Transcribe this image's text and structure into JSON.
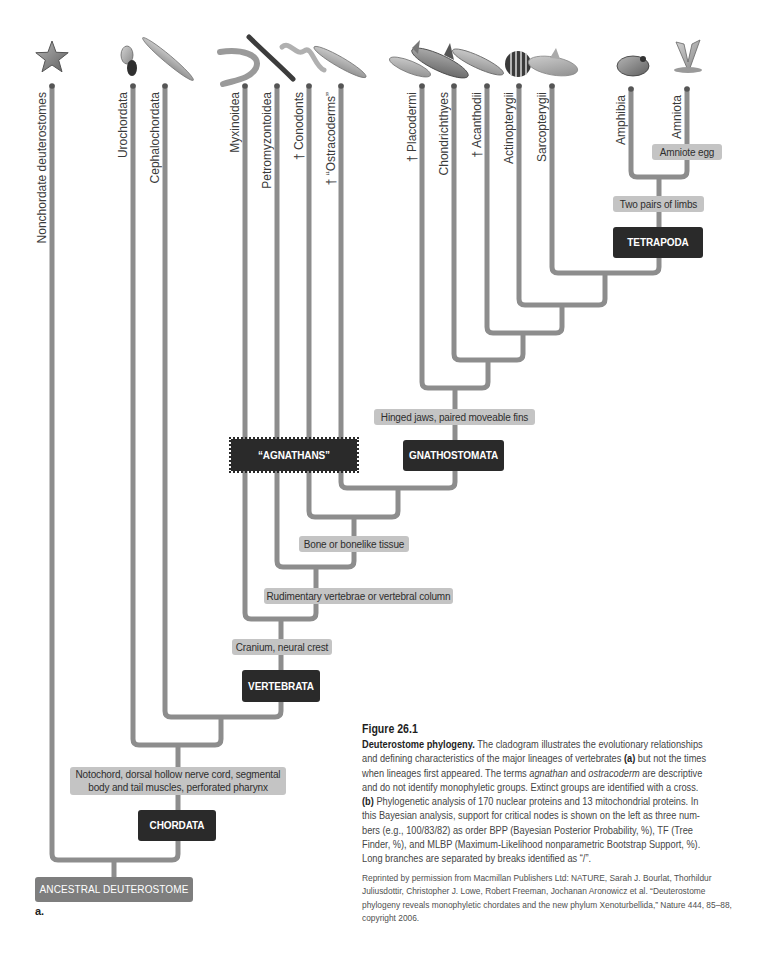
{
  "leaves": [
    {
      "label": "Nonchordate deuterostomes",
      "icon": "starfish"
    },
    {
      "label": "Urochordata",
      "icon": "sea-squirt"
    },
    {
      "label": "Cephalochordata",
      "icon": "lancelet"
    },
    {
      "label": "Myxinoidea",
      "icon": "hagfish"
    },
    {
      "label": "Petromyzontoidea",
      "icon": "lamprey"
    },
    {
      "label": "† Conodonts",
      "icon": "conodont"
    },
    {
      "label": "† “Ostracoderms”",
      "icon": "ostracoderm"
    },
    {
      "label": "† Placodermi",
      "icon": "placoderm"
    },
    {
      "label": "Chondrichthyes",
      "icon": "shark"
    },
    {
      "label": "† Acanthodii",
      "icon": "acanthodian"
    },
    {
      "label": "Actinopterygii",
      "icon": "ray-finned-fish"
    },
    {
      "label": "Sarcopterygii",
      "icon": "coelacanth"
    },
    {
      "label": "Amphibia",
      "icon": "frog"
    },
    {
      "label": "Amniota",
      "icon": "bird"
    }
  ],
  "characters": {
    "amniote_egg": "Amniote egg",
    "two_pairs_limbs": "Two pairs of limbs",
    "hinged_jaws": "Hinged jaws, paired moveable fins",
    "bone": "Bone or bonelike tissue",
    "vertebrae": "Rudimentary vertebrae or vertebral column",
    "cranium": "Cranium, neural crest",
    "notochord_line1": "Notochord, dorsal hollow nerve cord, segmental",
    "notochord_line2": "body and tail muscles, perforated pharynx"
  },
  "clades": {
    "tetrapoda": "TETRAPODA",
    "gnathostomata": "GNATHOSTOMATA",
    "agnathans": "“AGNATHANS”",
    "vertebrata": "VERTEBRATA",
    "chordata": "CHORDATA",
    "root": "ANCESTRAL DEUTEROSTOME"
  },
  "panel_label": "a.",
  "caption": {
    "title": "Figure 26.1",
    "lines": [
      [
        "Deuterostome phylogeny.",
        " The cladogram illustrates the evolutionary relationships"
      ],
      [
        "and defining characteristics of the major lineages of vertebrates ",
        "(a)",
        " but not the times"
      ],
      [
        "when lineages first appeared. The terms ",
        "agnathan",
        " and ",
        "ostracoderm",
        " are descriptive"
      ],
      [
        "and do not identify monophyletic groups. Extinct groups are identified with a cross."
      ],
      [
        "(b)",
        " Phylogenetic analysis of 170 nuclear proteins and 13 mitochondrial proteins. In"
      ],
      [
        "this Bayesian analysis, support for critical nodes is shown on the left as three num-"
      ],
      [
        "bers (e.g., 100/83/82) as order BPP (Bayesian Posterior Probability, %), TF (Tree"
      ],
      [
        "Finder, %), and MLBP (Maximum-Likelihood nonparametric Bootstrap Support, %)."
      ],
      [
        "Long branches are separated by breaks identified as “/”."
      ]
    ]
  },
  "credits": {
    "lines": [
      "Reprinted by permission from Macmillan Publishers Ltd: NATURE, Sarah J. Bourlat, Thorhildur",
      "Juliusdottir, Christopher J. Lowe, Robert Freeman, Jochanan Aronowicz et al. “Deuterostome",
      "phylogeny reveals monophyletic chordates and the new phylum Xenoturbellida,” Nature 444, 85–88,",
      "copyright 2006."
    ]
  },
  "colors": {
    "branch": "#8d8d8d",
    "character_box": "#c4c4c4",
    "clade_box": "#2a2a2a",
    "root_box": "#7e7e7e"
  }
}
